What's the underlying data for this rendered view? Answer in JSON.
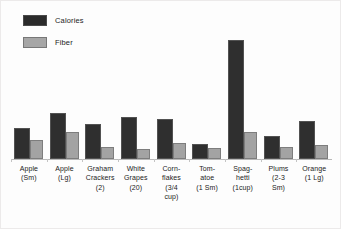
{
  "chart_data": {
    "type": "bar",
    "title": "",
    "xlabel": "",
    "ylabel": "",
    "grid": false,
    "legend_position": "top-left",
    "axis": {
      "y_visible": false,
      "x_visible": true,
      "ylim": [
        0,
        220
      ]
    },
    "categories": [
      "Apple (Sm)",
      "Apple (Lg)",
      "Graham Crackers (2)",
      "White Grapes (20)",
      "Corn-flakes (3/4 cup)",
      "Tom-atoe (1 Sm)",
      "Spag-hetti (1cup)",
      "Plums (2-3 Sm)",
      "Orange (1 Lg)"
    ],
    "category_lines": [
      [
        "Apple",
        "(Sm)"
      ],
      [
        "Apple",
        "(Lg)"
      ],
      [
        "Graham",
        "Crackers",
        "(2)"
      ],
      [
        "White",
        "Grapes",
        "(20)"
      ],
      [
        "Corn-",
        "flakes",
        "(3/4",
        "cup)"
      ],
      [
        "Tom-",
        "atoe",
        "(1 Sm)"
      ],
      [
        "Spag-",
        "hetti",
        "(1cup)"
      ],
      [
        "Plums",
        "(2-3",
        "Sm)"
      ],
      [
        "Orange",
        "(1 Lg)"
      ]
    ],
    "series": [
      {
        "name": "Calories",
        "color": "#2f2f2f",
        "values": [
          55,
          82,
          62,
          75,
          71,
          27,
          212,
          41,
          68
        ]
      },
      {
        "name": "Fiber",
        "color": "#a3a3a3",
        "values": [
          34,
          48,
          21,
          18,
          29,
          19,
          48,
          22,
          25
        ]
      }
    ]
  },
  "legend": {
    "items": [
      {
        "label": "Calories",
        "swatch": "calories"
      },
      {
        "label": "Fiber",
        "swatch": "fiber"
      }
    ]
  }
}
